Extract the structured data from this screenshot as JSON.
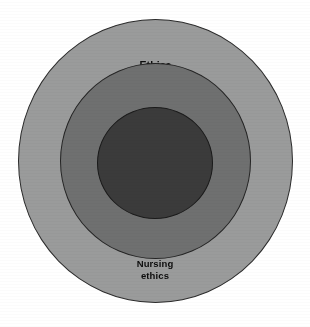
{
  "diagram": {
    "type": "concentric-circles",
    "background_color": "#ffffff",
    "rings": [
      {
        "id": "ethics",
        "label": "Ethics",
        "level": 1,
        "fill_color": "#9a9b9b",
        "stroke_color": "#2b2b2b",
        "label_color": "#0d0d0d"
      },
      {
        "id": "bioethics",
        "label": "Bioethics",
        "level": 2,
        "fill_color": "#6f7070",
        "stroke_color": "#242424",
        "label_color": "#0d0d0d"
      },
      {
        "id": "nursing-ethics",
        "label": "Nursing\nethics",
        "level": 3,
        "fill_color": "#3b3b3b",
        "stroke_color": "#1a1a1a",
        "label_color": "#0d0d0d"
      }
    ]
  }
}
